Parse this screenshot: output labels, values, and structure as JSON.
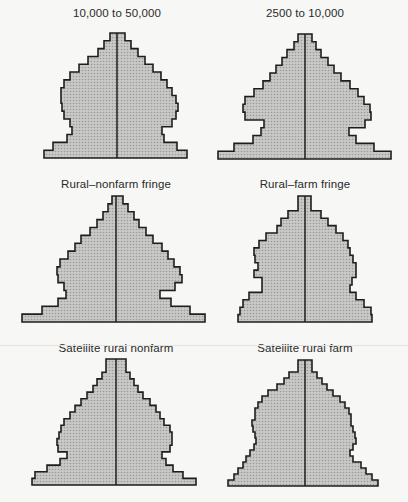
{
  "chart_data": [
    {
      "type": "bar",
      "subtype": "population-pyramid",
      "title": "10,000 to 50,000",
      "center_x": 117,
      "top_y": 33,
      "bottom_y": 158,
      "left_edges": [
        110,
        104,
        98,
        88,
        79,
        70,
        64,
        61,
        61,
        62,
        64,
        70,
        72,
        67,
        53,
        44
      ],
      "right_edges": [
        125,
        131,
        138,
        145,
        153,
        161,
        167,
        172,
        176,
        178,
        176,
        172,
        162,
        164,
        177,
        187
      ]
    },
    {
      "type": "bar",
      "subtype": "population-pyramid",
      "title": "2500 to 10,000",
      "center_x": 305,
      "top_y": 34,
      "bottom_y": 159,
      "left_edges": [
        298,
        294,
        287,
        282,
        276,
        270,
        263,
        254,
        245,
        243,
        245,
        264,
        261,
        253,
        234,
        218
      ],
      "right_edges": [
        312,
        316,
        321,
        328,
        334,
        341,
        350,
        358,
        364,
        370,
        371,
        365,
        349,
        356,
        374,
        391
      ]
    },
    {
      "type": "bar",
      "subtype": "population-pyramid",
      "title": "Rural–nonfarm fringe",
      "center_x": 116,
      "top_y": 196,
      "bottom_y": 322,
      "left_edges": [
        112,
        108,
        103,
        97,
        90,
        81,
        75,
        68,
        60,
        57,
        58,
        64,
        66,
        58,
        42,
        22
      ],
      "right_edges": [
        123,
        128,
        134,
        139,
        146,
        153,
        162,
        168,
        174,
        180,
        182,
        175,
        160,
        171,
        190,
        205
      ]
    },
    {
      "type": "bar",
      "subtype": "population-pyramid",
      "title": "Rural–farm fringe",
      "center_x": 305,
      "top_y": 196,
      "bottom_y": 322,
      "left_edges": [
        298,
        298,
        288,
        281,
        277,
        266,
        259,
        254,
        255,
        258,
        254,
        262,
        262,
        249,
        243,
        240,
        238
      ],
      "right_edges": [
        311,
        311,
        321,
        328,
        336,
        343,
        348,
        350,
        353,
        356,
        356,
        352,
        350,
        356,
        364,
        371,
        372
      ]
    },
    {
      "type": "bar",
      "subtype": "population-pyramid",
      "title": "Satellite rural nonfarm",
      "center_x": 116,
      "top_y": 359,
      "bottom_y": 485,
      "left_edges": [
        106,
        106,
        102,
        97,
        93,
        87,
        81,
        75,
        70,
        64,
        61,
        59,
        57,
        58,
        67,
        60,
        47,
        35,
        32
      ],
      "right_edges": [
        126,
        126,
        130,
        134,
        138,
        143,
        150,
        156,
        160,
        164,
        170,
        172,
        172,
        170,
        162,
        166,
        173,
        183,
        196
      ]
    },
    {
      "type": "bar",
      "subtype": "population-pyramid",
      "title": "Satellite rural farm",
      "center_x": 305,
      "top_y": 360,
      "bottom_y": 486,
      "left_edges": [
        298,
        298,
        289,
        284,
        277,
        268,
        262,
        258,
        255,
        255,
        252,
        253,
        255,
        256,
        254,
        250,
        246,
        243,
        238,
        234,
        228
      ],
      "right_edges": [
        312,
        312,
        317,
        322,
        327,
        333,
        340,
        345,
        349,
        351,
        351,
        353,
        355,
        356,
        353,
        350,
        353,
        361,
        366,
        372,
        378
      ]
    }
  ],
  "style": {
    "fill": "#bdbdbb",
    "outline": "#1e1e1e",
    "background": "#f7f7f5"
  }
}
